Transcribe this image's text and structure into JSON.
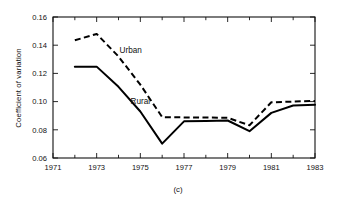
{
  "chart_data": {
    "type": "line",
    "title": "",
    "caption": "(c)",
    "xlabel": "",
    "ylabel": "Coefficient of variation",
    "xlim": [
      1971,
      1983
    ],
    "ylim": [
      0.06,
      0.16
    ],
    "grid": false,
    "legend_position": "inline-annotations",
    "x_ticks_major": [
      1971,
      1973,
      1975,
      1977,
      1979,
      1981,
      1983
    ],
    "x_tick_labels": [
      "1971",
      "1973",
      "1975",
      "1977",
      "1979",
      "1981",
      "1983"
    ],
    "x_ticks_minor": [
      1972,
      1974,
      1976,
      1978,
      1980,
      1982
    ],
    "y_ticks": [
      0.06,
      0.08,
      0.1,
      0.12,
      0.14,
      0.16
    ],
    "y_tick_labels": [
      "0.06",
      "0.08",
      "0.10",
      "0.12",
      "0.14",
      "0.16"
    ],
    "x": [
      1972,
      1973,
      1974,
      1975,
      1976,
      1977,
      1978,
      1979,
      1980,
      1981,
      1982,
      1983
    ],
    "series": [
      {
        "name": "Urban",
        "style": "dashed",
        "color": "#000000",
        "label_text": "Urban",
        "values": [
          0.1435,
          0.148,
          0.132,
          0.112,
          0.089,
          0.0888,
          0.0887,
          0.0885,
          0.0832,
          0.0995,
          0.1,
          0.1005
        ]
      },
      {
        "name": "Rural",
        "style": "solid",
        "color": "#000000",
        "label_text": "Rural",
        "values": [
          0.1248,
          0.1248,
          0.1105,
          0.093,
          0.0702,
          0.086,
          0.0863,
          0.0866,
          0.079,
          0.092,
          0.0972,
          0.0978
        ]
      }
    ],
    "annotations": [
      {
        "text": "Urban",
        "x": 1974.05,
        "y": 0.1345
      },
      {
        "text": "Rural",
        "x": 1974.55,
        "y": 0.0985
      }
    ]
  }
}
